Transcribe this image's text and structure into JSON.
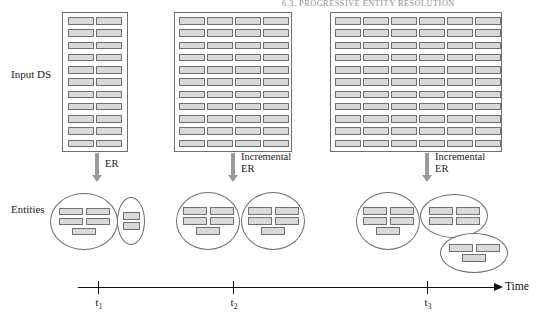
{
  "page": {
    "running_head": "6.3. PROGRESSIVE ENTITY RESOLUTION",
    "folio": "1"
  },
  "labels": {
    "input_ds": "Input DS",
    "entities": "Entities",
    "time_axis": "Time"
  },
  "colors": {
    "record_fill": "#d9d9d9",
    "record_stroke": "#6f6f6f",
    "block_stroke": "#6d6d6d",
    "arrow": "#9a9a9a",
    "axis": "#111111",
    "text": "#1b1b1b",
    "running_head": "#8d8d8d"
  },
  "stages": [
    {
      "id": "t1",
      "tick_label": "t",
      "tick_sub": "1",
      "tick_x": 98,
      "dataset": {
        "columns": 2,
        "rows": 11,
        "total_records": 22,
        "x": 62,
        "y": 12,
        "width": 66,
        "height": 140
      },
      "process_label": "ER",
      "arrow": {
        "x": 97,
        "y": 153,
        "length": 28
      },
      "entity_groups": [
        {
          "shape": "circle",
          "records_per_row": [
            2,
            2,
            1
          ],
          "total": 5,
          "x": 50,
          "y": 193,
          "width": 68,
          "height": 57,
          "size": "normal"
        },
        {
          "shape": "ellipse",
          "records_per_row": [
            1,
            1
          ],
          "total": 2,
          "x": 117,
          "y": 197,
          "width": 28,
          "height": 48,
          "size": "small"
        }
      ]
    },
    {
      "id": "t2",
      "tick_label": "t",
      "tick_sub": "2",
      "tick_x": 233,
      "dataset": {
        "columns": 4,
        "rows": 11,
        "total_records": 44,
        "x": 174,
        "y": 12,
        "width": 118,
        "height": 140
      },
      "process_label": "Incremental\nER",
      "arrow": {
        "x": 233,
        "y": 153,
        "length": 28
      },
      "entity_groups": [
        {
          "shape": "circle",
          "records_per_row": [
            2,
            2,
            1
          ],
          "total": 5,
          "x": 176,
          "y": 192,
          "width": 64,
          "height": 58,
          "size": "normal"
        },
        {
          "shape": "circle",
          "records_per_row": [
            2,
            2,
            1
          ],
          "total": 5,
          "x": 241,
          "y": 192,
          "width": 64,
          "height": 58,
          "size": "normal"
        }
      ]
    },
    {
      "id": "t3",
      "tick_label": "t",
      "tick_sub": "3",
      "tick_x": 427,
      "dataset": {
        "columns": 6,
        "rows": 11,
        "total_records": 66,
        "x": 330,
        "y": 12,
        "width": 172,
        "height": 140
      },
      "process_label": "Incremental\nER",
      "arrow": {
        "x": 427,
        "y": 153,
        "length": 28
      },
      "entity_groups": [
        {
          "shape": "circle",
          "records_per_row": [
            2,
            2,
            1
          ],
          "total": 5,
          "x": 356,
          "y": 192,
          "width": 64,
          "height": 58,
          "size": "normal"
        },
        {
          "shape": "ellipse",
          "records_per_row": [
            2,
            2
          ],
          "total": 4,
          "x": 420,
          "y": 194,
          "width": 68,
          "height": 44,
          "size": "normal"
        },
        {
          "shape": "ellipse",
          "records_per_row": [
            2,
            1
          ],
          "total": 3,
          "x": 440,
          "y": 233,
          "width": 68,
          "height": 40,
          "size": "normal"
        }
      ]
    }
  ]
}
